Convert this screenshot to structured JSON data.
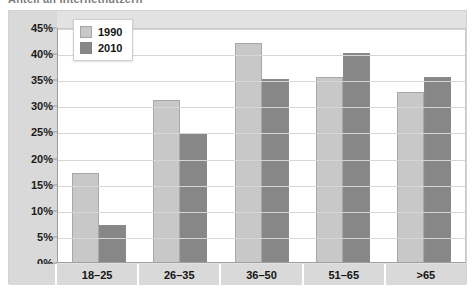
{
  "title_fragment": "Anteil an Internetnutzern",
  "legend": {
    "position": "top-left-inside",
    "entries": [
      {
        "label": "1990",
        "color": "#c8c8c8"
      },
      {
        "label": "2010",
        "color": "#878787"
      }
    ]
  },
  "axis": {
    "y_ticks": [
      "45%",
      "40%",
      "35%",
      "30%",
      "25%",
      "20%",
      "15%",
      "10%",
      "5%",
      "0%"
    ],
    "x_categories": [
      "18–25",
      "26–35",
      "36–50",
      "51–65",
      ">65"
    ]
  },
  "colors": {
    "series_1990": "#c8c8c8",
    "series_2010": "#878787",
    "plot_background": "#ffffff",
    "frame_background": "#e2e2e2",
    "axis_band": "#d9d9d9",
    "gridline": "#d6d6d6"
  },
  "chart_data": {
    "type": "bar",
    "title": "Anteil an Internetnutzern",
    "xlabel": "",
    "ylabel": "",
    "ylim": [
      0,
      45
    ],
    "ytick_step": 5,
    "ytick_format": "percent",
    "grid": true,
    "legend_position": "upper left",
    "categories": [
      "18–25",
      "26–35",
      "36–50",
      "51–65",
      ">65"
    ],
    "series": [
      {
        "name": "1990",
        "color": "#c8c8c8",
        "values": [
          17,
          31,
          42,
          35.5,
          32.5
        ]
      },
      {
        "name": "2010",
        "color": "#878787",
        "values": [
          7,
          24.5,
          35,
          40,
          35.5
        ]
      }
    ]
  }
}
